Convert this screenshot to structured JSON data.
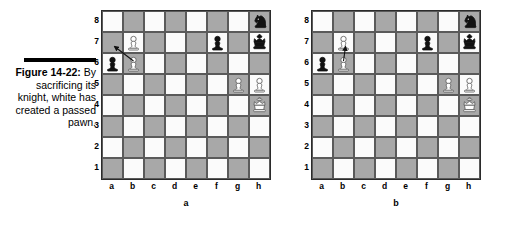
{
  "figure": {
    "number": "Figure 14-22:",
    "caption_lines": [
      "By",
      "sacrificing",
      "its knight,",
      "white has",
      "created a",
      "passed",
      "pawn."
    ]
  },
  "board_labels": {
    "files": [
      "a",
      "b",
      "c",
      "d",
      "e",
      "f",
      "g",
      "h"
    ],
    "ranks": [
      "8",
      "7",
      "6",
      "5",
      "4",
      "3",
      "2",
      "1"
    ]
  },
  "colors": {
    "light_square": "#fbfbfb",
    "dark_square": "#a8a8a8",
    "border": "#2b2b2b",
    "piece_black": "#111111",
    "piece_white_fill": "#ffffff",
    "piece_outline": "#555555",
    "text": "#000000"
  },
  "boards": [
    {
      "id": "a",
      "letter": "a",
      "pieces": [
        {
          "square": "h8",
          "color": "black",
          "type": "knight"
        },
        {
          "square": "b7",
          "color": "white",
          "type": "pawn"
        },
        {
          "square": "f7",
          "color": "black",
          "type": "pawn"
        },
        {
          "square": "h7",
          "color": "black",
          "type": "king"
        },
        {
          "square": "a6",
          "color": "black",
          "type": "pawn"
        },
        {
          "square": "b6",
          "color": "white",
          "type": "pawn"
        },
        {
          "square": "g5",
          "color": "white",
          "type": "pawn"
        },
        {
          "square": "h5",
          "color": "white",
          "type": "pawn"
        },
        {
          "square": "h4",
          "color": "white",
          "type": "king"
        }
      ],
      "arrow": {
        "from": "b6",
        "to": "a7",
        "description": "move-arrow-b6-to-a7"
      }
    },
    {
      "id": "b",
      "letter": "b",
      "pieces": [
        {
          "square": "h8",
          "color": "black",
          "type": "knight"
        },
        {
          "square": "b7",
          "color": "white",
          "type": "pawn"
        },
        {
          "square": "f7",
          "color": "black",
          "type": "pawn"
        },
        {
          "square": "h7",
          "color": "black",
          "type": "king"
        },
        {
          "square": "a6",
          "color": "black",
          "type": "pawn"
        },
        {
          "square": "b6",
          "color": "white",
          "type": "pawn"
        },
        {
          "square": "g5",
          "color": "white",
          "type": "pawn"
        },
        {
          "square": "h5",
          "color": "white",
          "type": "pawn"
        },
        {
          "square": "h4",
          "color": "white",
          "type": "king"
        }
      ],
      "arrow": {
        "from": "b6",
        "to": "b7",
        "description": "move-arrow-b6-to-b7"
      }
    }
  ]
}
